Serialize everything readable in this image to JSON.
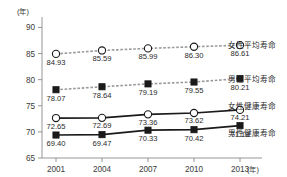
{
  "chart_data": {
    "type": "line",
    "title": "",
    "subtitle": "",
    "xlabel": "(年)",
    "ylabel": "(年)",
    "x": [
      2001,
      2004,
      2007,
      2010,
      2013
    ],
    "categories": [
      "2001",
      "2004",
      "2007",
      "2010",
      "2013"
    ],
    "ylim": [
      65,
      92
    ],
    "yticks": [
      65,
      70,
      75,
      80,
      85,
      90
    ],
    "ytick_labels": [
      "65",
      "70",
      "75",
      "80",
      "85",
      "90"
    ],
    "grid": false,
    "legend_position": "right",
    "series": [
      {
        "name": "女性平均寿命",
        "marker": "open-circle",
        "line_style": "dashed",
        "color": "#9a9a9a",
        "values": [
          84.93,
          85.59,
          85.99,
          86.3,
          86.61
        ],
        "labels": [
          "84.93",
          "85.59",
          "85.99",
          "86.30",
          "86.61"
        ]
      },
      {
        "name": "男性平均寿命",
        "marker": "filled-square",
        "line_style": "dashed",
        "color": "#9a9a9a",
        "values": [
          78.07,
          78.64,
          79.19,
          79.55,
          80.21
        ],
        "labels": [
          "78.07",
          "78.64",
          "79.19",
          "79.55",
          "80.21"
        ]
      },
      {
        "name": "女性健康寿命",
        "marker": "open-circle",
        "line_style": "solid",
        "color": "#1a1a1a",
        "values": [
          72.65,
          72.69,
          73.36,
          73.62,
          74.21
        ],
        "labels": [
          "72.65",
          "72.69",
          "73.36",
          "73.62",
          "74.21"
        ]
      },
      {
        "name": "男性健康寿命",
        "marker": "filled-square",
        "line_style": "solid",
        "color": "#1a1a1a",
        "values": [
          69.4,
          69.47,
          70.33,
          70.42,
          71.19
        ],
        "labels": [
          "69.40",
          "69.47",
          "70.33",
          "70.42",
          "71.19"
        ]
      }
    ]
  },
  "axis": {
    "y_unit": "(年)",
    "x_unit": "(年)"
  }
}
